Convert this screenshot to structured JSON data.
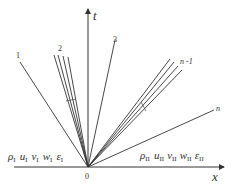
{
  "diagram": {
    "axes": {
      "vertical_label": "t",
      "horizontal_label": "x",
      "origin_label": "0"
    },
    "characteristic_labels": {
      "line1": "1",
      "fan2": "2",
      "line3": "3",
      "fan_n_minus_1": "n -1",
      "line_n": "n"
    },
    "left_state": {
      "symbols": [
        "ρ",
        "u",
        "v",
        "w",
        "ε"
      ],
      "subscript": "I"
    },
    "right_state": {
      "symbols": [
        "ρ",
        "u",
        "v",
        "w",
        "ε"
      ],
      "subscript": "II"
    },
    "line_color": "#333333"
  }
}
